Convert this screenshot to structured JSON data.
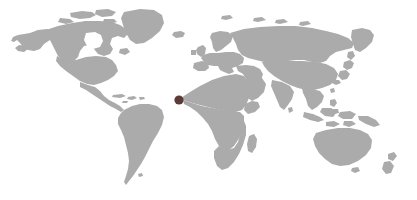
{
  "figure": {
    "type": "world-locator-map",
    "width": 417,
    "height": 200,
    "projection": "equirectangular",
    "background_color": "#ffffff",
    "land_color": "#ababab",
    "antarctica_shown": false,
    "labels_shown": false,
    "graticule_shown": false,
    "borders_shown": false,
    "title": "",
    "caption": ""
  },
  "marker": {
    "name": "location-marker",
    "shape": "circle",
    "color": "#5c3a36",
    "radius": 4.6,
    "center_x": 179,
    "center_y": 100,
    "region_label": "West Africa",
    "approx_longitude": -15.5,
    "approx_latitude": 13.5
  },
  "continents": [
    {
      "name": "North America"
    },
    {
      "name": "South America"
    },
    {
      "name": "Europe"
    },
    {
      "name": "Africa"
    },
    {
      "name": "Asia"
    },
    {
      "name": "Australia"
    }
  ],
  "chart_data": {
    "type": "map",
    "title": "",
    "xlabel": "",
    "ylabel": "",
    "projection": "equirectangular",
    "xlim": [
      -180,
      180
    ],
    "ylim": [
      -60,
      84
    ],
    "grid": false,
    "legend": "none",
    "series": [
      {
        "name": "highlighted-location",
        "values": [
          {
            "lon": -15.5,
            "lat": 13.5,
            "px_x": 179,
            "px_y": 100,
            "color": "#5c3a36",
            "size": 9.2
          }
        ]
      }
    ],
    "basemap": {
      "land_fill": "#ababab",
      "ocean_fill": "#ffffff",
      "features": [
        "North America",
        "South America",
        "Europe",
        "Africa",
        "Asia",
        "Australia",
        "Greenland",
        "Madagascar",
        "Japan",
        "New Zealand",
        "Indonesia",
        "Philippines",
        "Caribbean",
        "Iceland",
        "British Isles"
      ]
    }
  }
}
